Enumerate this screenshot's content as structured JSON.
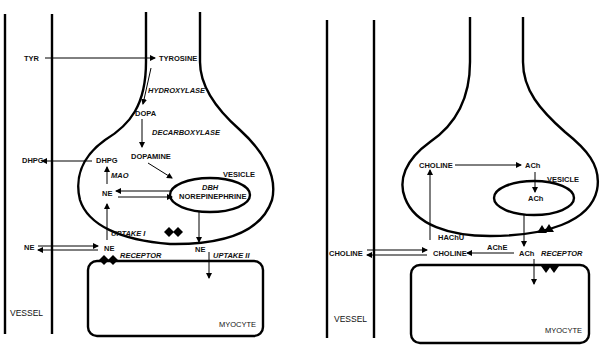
{
  "left_panel": {
    "title": "Noradrenergic nerve terminal",
    "labels": {
      "tyr": "TYR",
      "tyrosine": "TYROSINE",
      "hydroxylase": "HYDROXYLASE",
      "dopa": "DOPA",
      "decarboxylase": "DECARBOXYLASE",
      "dopamine": "DOPAMINE",
      "dhpg_out": "DHPG",
      "dhpg_in": "DHPG",
      "mao": "MAO",
      "vesicle": "VESICLE",
      "dbh": "DBH",
      "norepinephrine": "NOREPINEPHRINE",
      "ne_cyto": "NE",
      "uptake1": "UPTAKE I",
      "ne_vessel": "NE",
      "ne_cleft": "NE",
      "ne_release": "NE",
      "receptor": "RECEPTOR",
      "uptake2": "UPTAKE II",
      "vessel": "VESSEL",
      "myocyte": "MYOCYTE"
    }
  },
  "right_panel": {
    "title": "Cholinergic nerve terminal",
    "labels": {
      "choline_in": "CHOLINE",
      "ach_cyto": "ACh",
      "vesicle": "VESICLE",
      "ach_vesicle": "ACh",
      "hachu": "HAChU",
      "choline_vessel": "CHOLINE",
      "choline_cleft": "CHOLINE",
      "ache": "AChE",
      "ach_cleft": "ACh",
      "receptor": "RECEPTOR",
      "vessel": "VESSEL",
      "myocyte": "MYOCYTE"
    }
  },
  "colors": {
    "ink": "#000000",
    "background": "#ffffff"
  }
}
